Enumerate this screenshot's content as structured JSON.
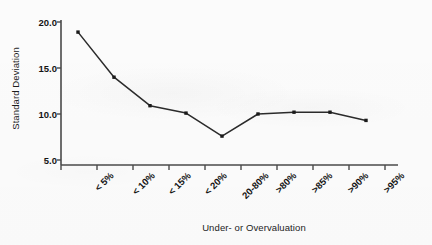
{
  "chart_data": {
    "type": "line",
    "title": "",
    "xlabel": "Under- or Overvaluation",
    "ylabel": "Standard Deviation",
    "categories": [
      "< 5%",
      "< 10%",
      "< 15%",
      "< 20%",
      "20-80%",
      ">80%",
      ">85%",
      ">90%",
      ">95%"
    ],
    "values": [
      18.9,
      14.0,
      10.9,
      10.1,
      7.6,
      10.0,
      10.2,
      10.2,
      9.3
    ],
    "ylim": [
      5.0,
      20.0
    ],
    "ytick_labels": [
      "20.0",
      "15.0",
      "10.0",
      "5.0"
    ],
    "ytick_values": [
      20.0,
      15.0,
      10.0,
      5.0
    ],
    "grid": false,
    "legend": false,
    "marker": "square",
    "line_color": "#2b2b2b",
    "marker_color": "#1a1a1a",
    "axis_color": "#4a4a4a",
    "text_color": "#141414"
  }
}
